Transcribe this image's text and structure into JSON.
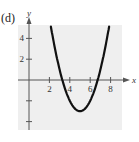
{
  "panel_label": "(d)",
  "chart_data": {
    "type": "line",
    "title": "",
    "xlabel": "x",
    "ylabel": "y",
    "xlim": [
      -1,
      9.5
    ],
    "ylim": [
      -5,
      5
    ],
    "x_ticks": [
      2,
      4,
      6,
      8
    ],
    "x_tick_labels": [
      "2",
      "4",
      "6",
      "8"
    ],
    "y_ticks": [
      4,
      2,
      -2,
      -4
    ],
    "y_tick_labels": [
      "4",
      "2",
      "",
      ""
    ],
    "grid": false,
    "background": "#efefef",
    "series": [
      {
        "name": "parabola",
        "equation": "y = (x - 5)^2 - 3",
        "vertex": [
          5,
          -3
        ],
        "x_intercepts": [
          3.27,
          6.73
        ],
        "color": "#111111",
        "x": [
          2.2,
          2.5,
          3,
          3.5,
          4,
          4.5,
          5,
          5.5,
          6,
          6.5,
          7,
          7.5,
          7.8
        ],
        "y": [
          4.84,
          3.25,
          1,
          -0.75,
          -2,
          -2.75,
          -3,
          -2.75,
          -2,
          -0.75,
          1,
          3.25,
          4.84
        ]
      }
    ]
  }
}
